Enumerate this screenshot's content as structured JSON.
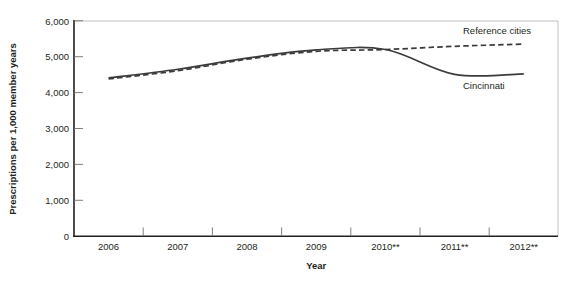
{
  "chart_data": {
    "type": "line",
    "title": "",
    "xlabel": "Year",
    "ylabel": "Prescriptions per 1,000 member years",
    "categories": [
      "2006",
      "2007",
      "2008",
      "2009",
      "2010**",
      "2011**",
      "2012**"
    ],
    "ylim": [
      0,
      6000
    ],
    "yticks": [
      0,
      1000,
      2000,
      3000,
      4000,
      5000,
      6000
    ],
    "ytick_labels": [
      "0",
      "1,000",
      "2,000",
      "3,000",
      "4,000",
      "5,000",
      "6,000"
    ],
    "grid": false,
    "legend_position": "inline-right",
    "series": [
      {
        "name": "Reference cities",
        "style": "dashed",
        "color": "#3b3b3b",
        "values": [
          4380,
          4610,
          4930,
          5150,
          5200,
          5290,
          5350
        ]
      },
      {
        "name": "Cincinnati",
        "style": "solid",
        "color": "#3b3b3b",
        "values": [
          4410,
          4650,
          4960,
          5190,
          5200,
          4510,
          4520
        ]
      }
    ],
    "annotations": [
      {
        "name": "reference-cities-label",
        "text": "Reference cities"
      },
      {
        "name": "cincinnati-label",
        "text": "Cincinnati"
      }
    ]
  }
}
